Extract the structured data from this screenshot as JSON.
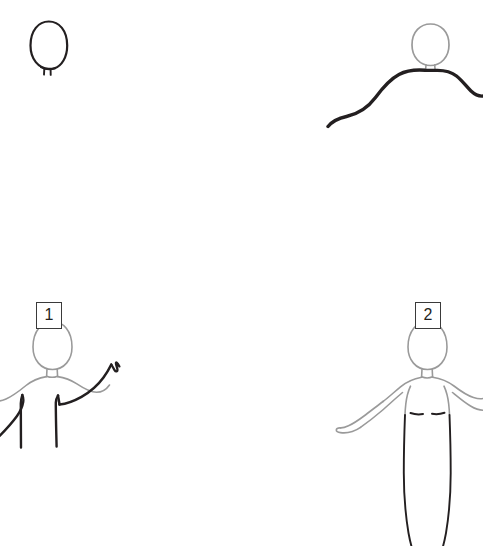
{
  "page": {
    "background_color": "#ffffff",
    "width": 483,
    "height": 546,
    "panel_count": 4
  },
  "colors": {
    "ink_dark": "#231f20",
    "ink_gray": "#9a9a9a",
    "badge_border": "#3a3a3a",
    "paper": "#ffffff"
  },
  "badges": [
    {
      "id": "1",
      "label": "1",
      "x": 36,
      "y": 302
    },
    {
      "id": "2",
      "label": "2",
      "x": 415,
      "y": 302
    }
  ],
  "panels": [
    {
      "id": "top-left",
      "name": "head-outline-only",
      "description": "Dark oval head outline with two short vertical neck ticks beneath it.",
      "stroke_color": "#231f20",
      "stroke_width": 2.2,
      "elements": [
        "head-oval",
        "neck-tick-left",
        "neck-tick-right"
      ]
    },
    {
      "id": "top-right",
      "name": "head-with-shoulder-curve",
      "description": "Light gray circular head with a bold dark S-curve forming sloping shoulders that run off the right edge.",
      "head_stroke_color": "#9a9a9a",
      "shoulder_stroke_color": "#231f20",
      "head_stroke_width": 1.6,
      "shoulder_stroke_width": 3.4,
      "elements": [
        "head-circle",
        "neck-stub",
        "shoulder-curve"
      ]
    },
    {
      "id": "bottom-left",
      "name": "torso-with-raised-arm",
      "description": "Gray outlined head, neck and torso with a bold dark raised right arm ending in a hand, plus two dark vertical body lines.",
      "body_stroke_color": "#9a9a9a",
      "accent_stroke_color": "#231f20",
      "body_stroke_width": 1.5,
      "accent_stroke_width": 2.4,
      "badge": "1",
      "elements": [
        "head-oval",
        "neck",
        "shoulder-line",
        "left-arm",
        "raised-arm",
        "hand",
        "torso-line-left",
        "torso-line-right"
      ]
    },
    {
      "id": "bottom-right",
      "name": "standing-figure-front",
      "description": "Gray outlined standing figure facing forward: head, neck, shoulders, both arms out with open left hand, narrow long skirt or legs drawn with dark tapering lines, and two short dark chest marks.",
      "body_stroke_color": "#9a9a9a",
      "accent_stroke_color": "#231f20",
      "body_stroke_width": 1.5,
      "accent_stroke_width": 1.8,
      "badge": "2",
      "elements": [
        "head-oval",
        "neck",
        "shoulders",
        "left-arm",
        "left-hand",
        "right-arm",
        "chest-mark-left",
        "chest-mark-right",
        "skirt-line-left",
        "skirt-line-right"
      ]
    }
  ]
}
